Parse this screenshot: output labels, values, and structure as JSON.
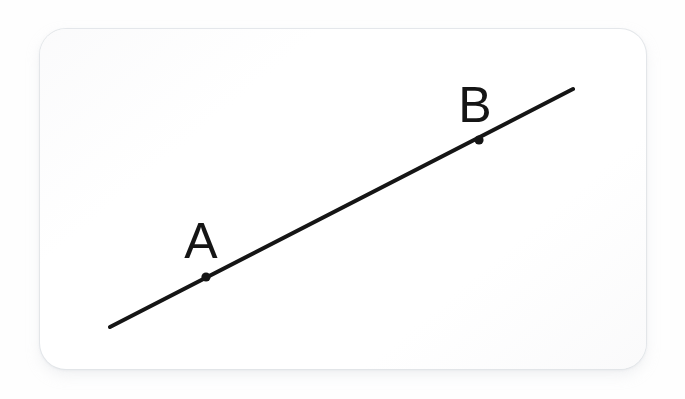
{
  "figure": {
    "kind": "geometry-line-diagram",
    "background_color": "#fefefe",
    "card_color": "#ffffff",
    "ink_color": "#151515",
    "canvas": {
      "width": 685,
      "height": 399
    },
    "card": {
      "x": 40,
      "y": 29,
      "width": 606,
      "height": 340,
      "corner_radius": 26
    },
    "line": {
      "label": "line",
      "stroke_color": "#151515",
      "stroke_width": 4,
      "start": {
        "x": 110,
        "y": 327
      },
      "end": {
        "x": 573,
        "y": 89
      }
    },
    "points": [
      {
        "label": "A",
        "dot_x": 206,
        "dot_y": 277,
        "dot_radius": 4.6,
        "label_x": 201,
        "label_y": 258,
        "label_font_size": 50
      },
      {
        "label": "B",
        "dot_x": 479,
        "dot_y": 140,
        "dot_radius": 4.6,
        "label_x": 475,
        "label_y": 122,
        "label_font_size": 50
      }
    ]
  }
}
